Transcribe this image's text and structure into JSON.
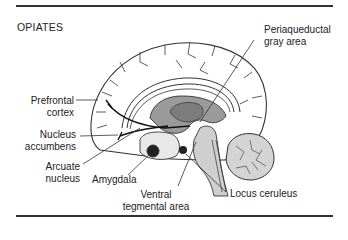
{
  "figure": {
    "title": "OPIATES"
  },
  "labels": {
    "periaqueductal_line1": "Periaqueductal",
    "periaqueductal_line2": "gray area",
    "prefrontal_line1": "Prefrontal",
    "prefrontal_line2": "cortex",
    "accumbens_line1": "Nucleus",
    "accumbens_line2": "accumbens",
    "arcuate_line1": "Arcuate",
    "arcuate_line2": "nucleus",
    "amygdala": "Amygdala",
    "vta_line1": "Ventral",
    "vta_line2": "tegmental area",
    "locus": "Locus ceruleus"
  },
  "colors": {
    "outline": "#333333",
    "fill_dark": "#8a8a8a",
    "fill_mid": "#b0b0b0",
    "fill_light": "#d6d6d6",
    "background": "#ffffff"
  }
}
